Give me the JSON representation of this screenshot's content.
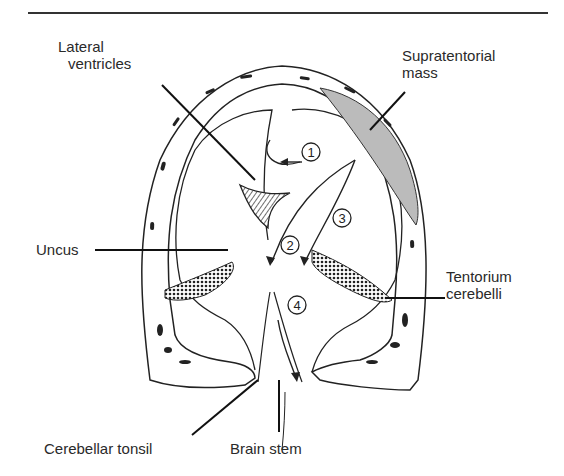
{
  "figure": {
    "labels": {
      "lateral_ventricles": [
        "Lateral",
        "ventricles"
      ],
      "supratentorial_mass": [
        "Supratentorial",
        "mass"
      ],
      "uncus": "Uncus",
      "tentorium_cerebelli": [
        "Tentorium",
        "cerebelli"
      ],
      "cerebellar_tonsil": "Cerebellar tonsil",
      "brain_stem": "Brain stem"
    },
    "markers": [
      "1",
      "2",
      "3",
      "4"
    ]
  }
}
